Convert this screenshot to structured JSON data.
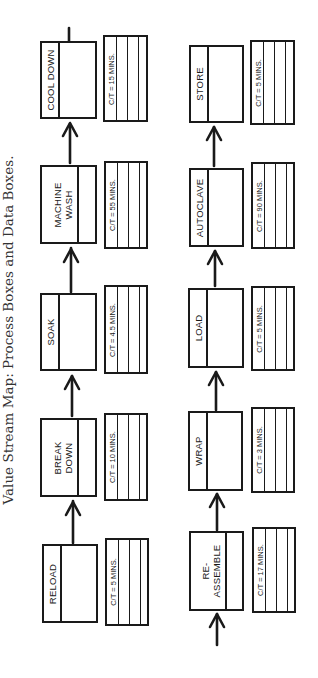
{
  "caption": "Value Stream Map: Process Boxes and Data Boxes.",
  "flow_direction": "bottom-to-top (page rotated 90° counter-clockwise)",
  "rows": [
    {
      "name": "top-row",
      "steps": [
        {
          "label": "RELOAD",
          "label_lines": [
            "RELOAD"
          ],
          "cycle_time": "C/T = 5 MINS."
        },
        {
          "label": "BREAK DOWN",
          "label_lines": [
            "BREAK",
            "DOWN"
          ],
          "cycle_time": "C/T = 10 MINS."
        },
        {
          "label": "SOAK",
          "label_lines": [
            "SOAK"
          ],
          "cycle_time": "C/T = 4.5 MINS."
        },
        {
          "label": "MACHINE WASH",
          "label_lines": [
            "MACHINE",
            "WASH"
          ],
          "cycle_time": "C/T = 55 MINS."
        },
        {
          "label": "COOL DOWN",
          "label_lines": [
            "COOL DOWN"
          ],
          "cycle_time": "C/T = 15 MINS."
        }
      ]
    },
    {
      "name": "bottom-row",
      "steps": [
        {
          "label": "RE-ASSEMBLE",
          "label_lines": [
            "RE-",
            "ASSEMBLE"
          ],
          "cycle_time": "C/T = 17 MINS."
        },
        {
          "label": "WRAP",
          "label_lines": [
            "WRAP"
          ],
          "cycle_time": "C/T = 3 MINS."
        },
        {
          "label": "LOAD",
          "label_lines": [
            "LOAD"
          ],
          "cycle_time": "C/T = 5 MINS."
        },
        {
          "label": "AUTOCLAVE",
          "label_lines": [
            "AUTOCLAVE"
          ],
          "cycle_time": "C/T = 90 MINS."
        },
        {
          "label": "STORE",
          "label_lines": [
            "STORE"
          ],
          "cycle_time": "C/T = 5 MINS."
        }
      ]
    }
  ],
  "colors": {
    "ink": "#1a1a1a",
    "background": "#ffffff",
    "caption": "#333333"
  }
}
